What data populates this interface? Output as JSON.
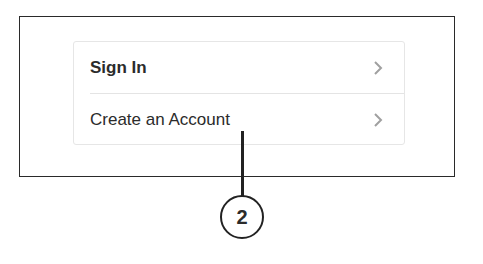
{
  "menu": {
    "items": [
      {
        "label": "Sign In",
        "icon": "chevron-right-icon"
      },
      {
        "label": "Create an Account",
        "icon": "chevron-right-icon"
      }
    ]
  },
  "callout": {
    "number": "2"
  },
  "colors": {
    "frame": "#2a2a2a",
    "text": "#2b2b2b",
    "chevron": "#a0a0a0",
    "divider": "#e4e4e4"
  }
}
